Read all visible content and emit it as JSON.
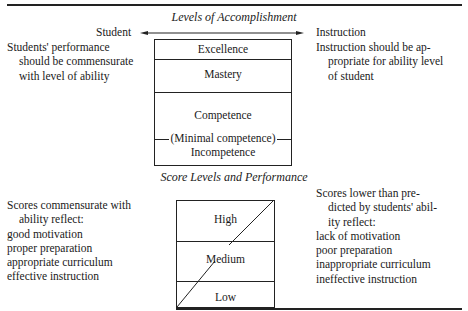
{
  "figure1": {
    "title": "Levels of Accomplishment",
    "arrow_left_label": "Student",
    "arrow_right_label": "Instruction",
    "left_note": [
      "Students' performance",
      "should be commensurate",
      "with level of ability"
    ],
    "right_note": [
      "Instruction should be ap-",
      "propriate for ability level",
      "of student"
    ],
    "levels": [
      {
        "label": "Excellence"
      },
      {
        "label": "Mastery"
      },
      {
        "label": "Competence"
      },
      {
        "label": "(Minimal competence)"
      },
      {
        "label": "Incompetence"
      }
    ]
  },
  "figure2": {
    "title": "Score Levels and Performance",
    "left_note": [
      "Scores commensurate with",
      "ability reflect:",
      "good motivation",
      "proper preparation",
      "appropriate curriculum",
      "effective instruction"
    ],
    "right_note": [
      "Scores lower than pre-",
      "dicted by students' abil-",
      "ity reflect:",
      "lack of motivation",
      "poor preparation",
      "inappropriate curriculum",
      "ineffective instruction"
    ],
    "levels": [
      {
        "label": "High"
      },
      {
        "label": "Medium"
      },
      {
        "label": "Low"
      }
    ]
  }
}
